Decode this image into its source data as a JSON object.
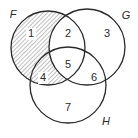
{
  "diagram": {
    "type": "venn",
    "sets": [
      {
        "name": "F",
        "label": "F",
        "cx": 48,
        "cy": 48,
        "r": 37,
        "label_x": 13,
        "label_y": 15
      },
      {
        "name": "G",
        "label": "G",
        "cx": 87,
        "cy": 47,
        "r": 38,
        "label_x": 126,
        "label_y": 16
      },
      {
        "name": "H",
        "label": "H",
        "cx": 68,
        "cy": 85,
        "r": 38,
        "label_x": 106,
        "label_y": 122
      }
    ],
    "regions": [
      {
        "id": "1",
        "label": "1",
        "x": 31,
        "y": 34,
        "sets": [
          "F"
        ],
        "shaded": true
      },
      {
        "id": "2",
        "label": "2",
        "x": 68,
        "y": 34,
        "sets": [
          "F",
          "G"
        ],
        "shaded": false
      },
      {
        "id": "3",
        "label": "3",
        "x": 107,
        "y": 34,
        "sets": [
          "G"
        ],
        "shaded": false
      },
      {
        "id": "4",
        "label": "4",
        "x": 43,
        "y": 78,
        "sets": [
          "F",
          "H"
        ],
        "shaded": true
      },
      {
        "id": "5",
        "label": "5",
        "x": 68,
        "y": 65,
        "sets": [
          "F",
          "G",
          "H"
        ],
        "shaded": false
      },
      {
        "id": "6",
        "label": "6",
        "x": 94,
        "y": 78,
        "sets": [
          "G",
          "H"
        ],
        "shaded": false
      },
      {
        "id": "7",
        "label": "7",
        "x": 68,
        "y": 108,
        "sets": [
          "H"
        ],
        "shaded": false
      }
    ],
    "shading": {
      "description": "F minus G (regions 1 and 4)",
      "pattern": "diagonal-hatch",
      "color": "#8a8a8a"
    },
    "stroke_color": "#2a2a2a"
  }
}
